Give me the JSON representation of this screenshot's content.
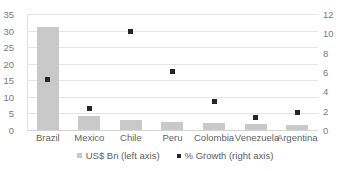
{
  "chart_data": {
    "type": "bar",
    "title": "",
    "subtitle": "",
    "xlabel": "",
    "ylabel": "",
    "categories": [
      "Brazil",
      "Mexico",
      "Chile",
      "Peru",
      "Colombia",
      "Venezuela",
      "Argentina"
    ],
    "series": [
      {
        "name": "US$ Bn (left axis)",
        "type": "bar",
        "axis": "left",
        "color": "#c9c9c9",
        "values": [
          31,
          4.3,
          3.0,
          2.5,
          2.2,
          1.8,
          1.5
        ]
      },
      {
        "name": "% Growth (right axis)",
        "type": "scatter",
        "axis": "right",
        "color": "#262626",
        "values": [
          5.2,
          2.2,
          10.2,
          6.1,
          3.0,
          1.3,
          1.8
        ]
      }
    ],
    "left_axis": {
      "ticks": [
        "0",
        "5",
        "10",
        "15",
        "20",
        "25",
        "30",
        "35"
      ],
      "tick_values": [
        0,
        5,
        10,
        15,
        20,
        25,
        30,
        35
      ],
      "ylim": [
        0,
        35
      ]
    },
    "right_axis": {
      "ticks": [
        "0",
        "2",
        "4",
        "6",
        "8",
        "10",
        "12"
      ],
      "tick_values": [
        0,
        2,
        4,
        6,
        8,
        10,
        12
      ],
      "ylim": [
        0,
        12
      ]
    },
    "grid": true,
    "legend_position": "bottom",
    "legend": [
      {
        "label": "US$ Bn (left axis)",
        "marker": "square-swatch-icon",
        "color": "#c9c9c9"
      },
      {
        "label": "% Growth (right axis)",
        "marker": "dot-marker-icon",
        "color": "#262626"
      }
    ]
  }
}
